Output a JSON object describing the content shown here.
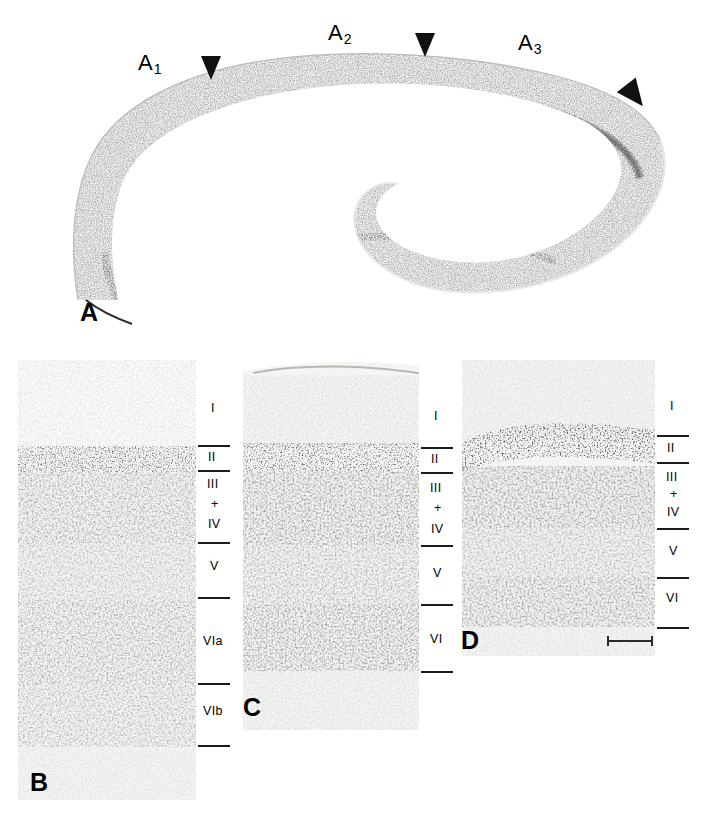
{
  "figure": {
    "panels": [
      {
        "letter": "A",
        "letter_x": 80,
        "letter_y": 300,
        "region_labels": [
          {
            "base": "A",
            "sub": "1",
            "x": 138,
            "y": 52
          },
          {
            "base": "A",
            "sub": "2",
            "x": 328,
            "y": 22
          },
          {
            "base": "A",
            "sub": "3",
            "x": 518,
            "y": 32
          }
        ],
        "arrowheads": [
          {
            "name": "arrowhead-border-a1-a2",
            "x": 200,
            "y": 55,
            "size": 22,
            "rotation": 0
          },
          {
            "name": "arrowhead-border-a2-a3",
            "x": 414,
            "y": 32,
            "size": 22,
            "rotation": 0
          },
          {
            "name": "arrowhead-caudal-border",
            "x": 614,
            "y": 92,
            "size": 26,
            "rotation": -35
          }
        ]
      },
      {
        "letter": "B",
        "letter_x": 30,
        "letter_y": 770,
        "layers": [
          {
            "label": "I",
            "label_y": 408
          },
          {
            "label": "II",
            "label_y": 456
          },
          {
            "label": "III",
            "label_y": 485
          },
          {
            "label": "+",
            "label_y": 505
          },
          {
            "label": "IV",
            "label_y": 527
          },
          {
            "label": "V",
            "label_y": 565
          },
          {
            "label": "VIa",
            "label_y": 645
          },
          {
            "label": "VIb",
            "label_y": 715
          }
        ],
        "ticks_y": [
          445,
          470,
          542,
          597,
          683,
          745
        ]
      },
      {
        "letter": "C",
        "letter_x": 243,
        "letter_y": 695,
        "layers": [
          {
            "label": "I",
            "label_y": 415
          },
          {
            "label": "II",
            "label_y": 458
          },
          {
            "label": "III",
            "label_y": 487
          },
          {
            "label": "+",
            "label_y": 507
          },
          {
            "label": "IV",
            "label_y": 530
          },
          {
            "label": "V",
            "label_y": 572
          },
          {
            "label": "VI",
            "label_y": 645
          }
        ],
        "ticks_y": [
          447,
          472,
          545,
          604,
          671
        ]
      },
      {
        "letter": "D",
        "letter_x": 461,
        "letter_y": 628,
        "layers": [
          {
            "label": "I",
            "label_y": 400
          },
          {
            "label": "II",
            "label_y": 448
          },
          {
            "label": "III",
            "label_y": 478
          },
          {
            "label": "+",
            "label_y": 495
          },
          {
            "label": "IV",
            "label_y": 513
          },
          {
            "label": "V",
            "label_y": 552
          },
          {
            "label": "VI",
            "label_y": 597
          }
        ],
        "ticks_y": [
          435,
          462,
          528,
          577,
          627
        ],
        "scale_bar": {
          "x": 607,
          "y": 636,
          "width": 46
        }
      }
    ]
  },
  "colors": {
    "ink": "#1b1b1b",
    "tissue_light": "#f2f2f0",
    "tissue_mid": "#9a9a98",
    "tissue_dark": "#3a3a3a",
    "background": "#ffffff"
  }
}
